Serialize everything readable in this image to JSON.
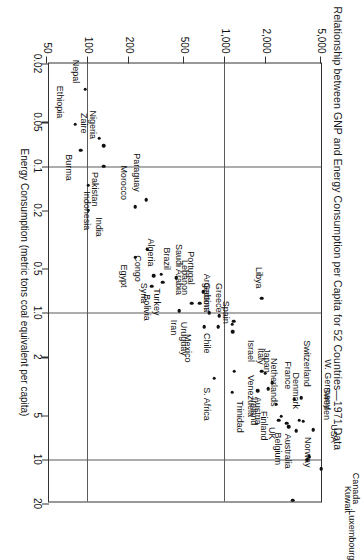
{
  "chart_data": {
    "type": "scatter",
    "title": "Relationship between GNP and Energy Consumption per Capita for 52 Countries—1971 Data",
    "xlabel": "Energy Consumption (metric tons coal equivalent per capita)",
    "ylabel": "GNP ($ per capita)",
    "xscale": "log",
    "yscale": "log",
    "xlim": [
      0.02,
      20
    ],
    "ylim": [
      50,
      5000
    ],
    "xticks": [
      "0.02",
      "0.05",
      "0.1",
      "0.2",
      "0.5",
      "1.0",
      "2",
      "5",
      "10",
      "20"
    ],
    "xtick_values": [
      0.02,
      0.05,
      0.1,
      0.2,
      0.5,
      1.0,
      2,
      5,
      10,
      20
    ],
    "yticks": [
      "50",
      "100",
      "200",
      "500",
      "1,000",
      "2,000",
      "5,000"
    ],
    "ytick_values": [
      50,
      100,
      200,
      500,
      1000,
      2000,
      5000
    ],
    "gridlines_x": [
      0.1,
      1.0,
      10
    ],
    "gridlines_y": [
      100,
      1000
    ],
    "grid": true,
    "legend": false,
    "points": [
      {
        "name": "USA",
        "x": 11.6,
        "y": 5000,
        "lx": -26,
        "ly": -12,
        "anchor": "end"
      },
      {
        "name": "Sweden",
        "x": 6.3,
        "y": 4400,
        "lx": -10,
        "ly": -13,
        "anchor": "end"
      },
      {
        "name": "Canada",
        "x": 9.6,
        "y": 4100,
        "lx": 16,
        "ly": -46,
        "anchor": "start"
      },
      {
        "name": "Kuwait",
        "x": 10.1,
        "y": 3950,
        "lx": 26,
        "ly": -40,
        "anchor": "start"
      },
      {
        "name": "W. Germany",
        "x": 5.5,
        "y": 3700,
        "lx": -12,
        "ly": -24,
        "anchor": "end"
      },
      {
        "name": "Switzerland",
        "x": 3.8,
        "y": 3600,
        "lx": -11,
        "ly": -5,
        "anchor": "end"
      },
      {
        "name": "Denmark",
        "x": 5.4,
        "y": 3450,
        "lx": -11,
        "ly": 4,
        "anchor": "end"
      },
      {
        "name": "Norway",
        "x": 6.4,
        "y": 3300,
        "lx": 6,
        "ly": -11,
        "anchor": "start"
      },
      {
        "name": "France",
        "x": 3.9,
        "y": 3200,
        "lx": -10,
        "ly": 7,
        "anchor": "end"
      },
      {
        "name": "Luxembourg",
        "x": 19.0,
        "y": 3100,
        "lx": 10,
        "ly": -58,
        "anchor": "start"
      },
      {
        "name": "Australia",
        "x": 6.0,
        "y": 2900,
        "lx": 7,
        "ly": 2,
        "anchor": "start"
      },
      {
        "name": "Netherlands",
        "x": 5.1,
        "y": 2550,
        "lx": -10,
        "ly": 8,
        "anchor": "end"
      },
      {
        "name": "Belgium",
        "x": 5.7,
        "y": 2800,
        "lx": 9,
        "ly": 10,
        "anchor": "start"
      },
      {
        "name": "UK",
        "x": 5.4,
        "y": 2450,
        "lx": 7,
        "ly": 8,
        "anchor": "start"
      },
      {
        "name": "Japan",
        "x": 3.0,
        "y": 2200,
        "lx": -10,
        "ly": 6,
        "anchor": "end"
      },
      {
        "name": "Finland",
        "x": 4.2,
        "y": 2350,
        "lx": 7,
        "ly": 13,
        "anchor": "start"
      },
      {
        "name": "Italy",
        "x": 2.6,
        "y": 1960,
        "lx": -9,
        "ly": 5,
        "anchor": "end"
      },
      {
        "name": "Israel",
        "x": 2.5,
        "y": 1850,
        "lx": -9,
        "ly": 12,
        "anchor": "end"
      },
      {
        "name": "Ireland",
        "x": 3.4,
        "y": 1720,
        "lx": 7,
        "ly": 5,
        "anchor": "start"
      },
      {
        "name": "Austria",
        "x": 3.3,
        "y": 2050,
        "lx": 8,
        "ly": 11,
        "anchor": "start"
      },
      {
        "name": "Venezuela",
        "x": 2.5,
        "y": 1160,
        "lx": 4,
        "ly": -16,
        "anchor": "start"
      },
      {
        "name": "Trinidad",
        "x": 3.5,
        "y": 1120,
        "lx": 8,
        "ly": -7,
        "anchor": "start"
      },
      {
        "name": "S. Africa",
        "x": 2.8,
        "y": 830,
        "lx": 9,
        "ly": 8,
        "anchor": "start"
      },
      {
        "name": "Spain",
        "x": 1.35,
        "y": 1130,
        "lx": -8,
        "ly": 8,
        "anchor": "end"
      },
      {
        "name": "Greece",
        "x": 1.15,
        "y": 1150,
        "lx": -9,
        "ly": 16,
        "anchor": "end"
      },
      {
        "name": "Gabon",
        "x": 1.05,
        "y": 900,
        "lx": -6,
        "ly": 13,
        "anchor": "end"
      },
      {
        "name": "Chile",
        "x": 1.25,
        "y": 890,
        "lx": 6,
        "ly": 12,
        "anchor": "start"
      },
      {
        "name": "Argentina",
        "x": 1.2,
        "y": 1120,
        "lx": -12,
        "ly": 26,
        "anchor": "end"
      },
      {
        "name": "Mexico",
        "x": 1.25,
        "y": 700,
        "lx": 7,
        "ly": 17,
        "anchor": "start"
      },
      {
        "name": "Uruguay",
        "x": 1.0,
        "y": 760,
        "lx": 9,
        "ly": 26,
        "anchor": "start"
      },
      {
        "name": "Portugal",
        "x": 0.72,
        "y": 690,
        "lx": -7,
        "ly": 13,
        "anchor": "end"
      },
      {
        "name": "Saudi Arabia",
        "x": 0.86,
        "y": 650,
        "lx": -8,
        "ly": 22,
        "anchor": "end"
      },
      {
        "name": "Lebanon",
        "x": 0.86,
        "y": 570,
        "lx": -8,
        "ly": 8,
        "anchor": "end"
      },
      {
        "name": "Iran",
        "x": 0.97,
        "y": 460,
        "lx": 9,
        "ly": 6,
        "anchor": "start"
      },
      {
        "name": "Brazil",
        "x": 0.58,
        "y": 440,
        "lx": -8,
        "ly": 10,
        "anchor": "end"
      },
      {
        "name": "Turkey",
        "x": 0.62,
        "y": 350,
        "lx": 6,
        "ly": 7,
        "anchor": "start"
      },
      {
        "name": "Algeria",
        "x": 0.55,
        "y": 340,
        "lx": -8,
        "ly": 11,
        "anchor": "end"
      },
      {
        "name": "Syria",
        "x": 0.56,
        "y": 300,
        "lx": 7,
        "ly": 11,
        "anchor": "start"
      },
      {
        "name": "Bolivia",
        "x": 0.66,
        "y": 290,
        "lx": 8,
        "ly": 6,
        "anchor": "start"
      },
      {
        "name": "Congo",
        "x": 0.37,
        "y": 270,
        "lx": 6,
        "ly": 10,
        "anchor": "start"
      },
      {
        "name": "Egypt",
        "x": 0.42,
        "y": 220,
        "lx": 7,
        "ly": 12,
        "anchor": "start"
      },
      {
        "name": "Libya",
        "x": 0.8,
        "y": 1850,
        "lx": -10,
        "ly": 4,
        "anchor": "end"
      },
      {
        "name": "Paraguay",
        "x": 0.17,
        "y": 265,
        "lx": -8,
        "ly": 10,
        "anchor": "end"
      },
      {
        "name": "Morocco",
        "x": 0.19,
        "y": 220,
        "lx": -7,
        "ly": 12,
        "anchor": "end"
      },
      {
        "name": "India",
        "x": 0.2,
        "y": 100,
        "lx": 7,
        "ly": -10,
        "anchor": "start"
      },
      {
        "name": "Pakistan",
        "x": 0.1,
        "y": 130,
        "lx": 6,
        "ly": 10,
        "anchor": "start"
      },
      {
        "name": "Indonesia",
        "x": 0.135,
        "y": 100,
        "lx": 6,
        "ly": 2,
        "anchor": "start"
      },
      {
        "name": "Nigeria",
        "x": 0.073,
        "y": 130,
        "lx": -7,
        "ly": 12,
        "anchor": "end"
      },
      {
        "name": "Zaire",
        "x": 0.065,
        "y": 120,
        "lx": -5,
        "ly": 16,
        "anchor": "end"
      },
      {
        "name": "Burma",
        "x": 0.078,
        "y": 88,
        "lx": 4,
        "ly": 13,
        "anchor": "start"
      },
      {
        "name": "Ethiopia",
        "x": 0.052,
        "y": 80,
        "lx": -6,
        "ly": 16,
        "anchor": "end"
      },
      {
        "name": "Nepal",
        "x": 0.03,
        "y": 95,
        "lx": -6,
        "ly": 10,
        "anchor": "end"
      }
    ]
  }
}
